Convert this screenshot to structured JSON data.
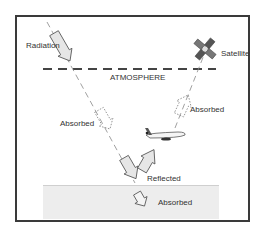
{
  "diagram": {
    "labels": {
      "radiation": "Radiation",
      "satellite": "Satellite",
      "atmosphere": "ATMOSPHERE",
      "absorbed_atmosphere_left": "Absorbed",
      "absorbed_atmosphere_right": "Absorbed",
      "reflected": "Reflected",
      "absorbed_ground": "Absorbed"
    },
    "icons": {
      "satellite": "satellite-icon",
      "airplane": "airplane-icon"
    },
    "colors": {
      "frame": "#3a3a3a",
      "arrow_fill": "#e6e6e6",
      "arrow_stroke": "#555555",
      "dash_line": "#444444",
      "ground": "#ededed"
    }
  }
}
